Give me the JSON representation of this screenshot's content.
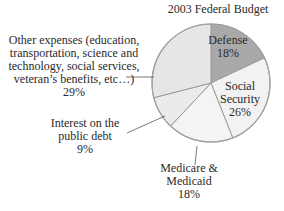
{
  "chart_data": {
    "type": "pie",
    "title": "2003 Federal Budget",
    "start": "top",
    "direction": "clockwise",
    "slices": [
      {
        "label_lines": [
          "Defense",
          "18%"
        ],
        "name": "Defense",
        "value": 18,
        "color": "#a9a9a9",
        "label_position": "inside"
      },
      {
        "label_lines": [
          "Social",
          "Security",
          "26%"
        ],
        "name": "Social Security",
        "value": 26,
        "color": "#f2f2f2",
        "label_position": "inside"
      },
      {
        "label_lines": [
          "Medicare &",
          "Medicaid",
          "18%"
        ],
        "name": "Medicare & Medicaid",
        "value": 18,
        "color": "#f4f4f4",
        "label_position": "outside-bottom"
      },
      {
        "label_lines": [
          "Interest on the",
          "public debt",
          "9%"
        ],
        "name": "Interest on the public debt",
        "value": 9,
        "color": "#ebebeb",
        "label_position": "outside-left"
      },
      {
        "label_lines": [
          "Other expenses (education,",
          "transportation, science and",
          "technology, social services,",
          "veteran’s benefits, etc…)",
          "29%"
        ],
        "name": "Other expenses",
        "value": 29,
        "color": "#e6e6e6",
        "label_position": "outside-left"
      }
    ],
    "outline_color": "#9a9a9a"
  }
}
